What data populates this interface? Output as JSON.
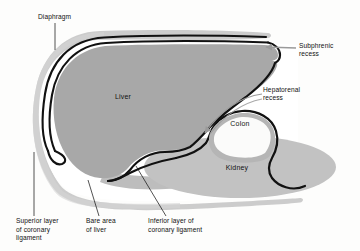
{
  "figure": {
    "background_color": "#fdfdfc"
  },
  "colors": {
    "body_wall": "#c9c9c9",
    "liver_fill": "#a8a8a8",
    "kidney_fill": "#c2c2c2",
    "bare_area_fill": "#bdbdbd",
    "colon_ring": "#b5b5b5",
    "colon_lumen": "#fbfbfa",
    "peritoneum_line": "#111111",
    "cavity_white": "#ffffff",
    "arrow_gray": "#9a9a9a",
    "leader_line": "#1a1a1a",
    "text": "#111111"
  },
  "organs": [
    {
      "name": "liver",
      "label": "Liver",
      "x": 123,
      "y": 99
    },
    {
      "name": "kidney",
      "label": "Kidney",
      "x": 237,
      "y": 170
    },
    {
      "name": "colon",
      "label": "Colon",
      "x": 238,
      "y": 124
    }
  ],
  "annotations": [
    {
      "name": "diaphragm",
      "label": "Diaphragm",
      "lines": [
        "Diaphragm"
      ],
      "text_x": 38,
      "text_y": 19,
      "anchor": "start",
      "leader": "M 55 23 L 55 50",
      "pointer_type": "line"
    },
    {
      "name": "subphrenic-recess",
      "label": "Subphrenic recess",
      "lines": [
        "Subphrenic",
        "recess"
      ],
      "text_x": 299,
      "text_y": 48,
      "anchor": "start",
      "leader": "M 296 48 L 265 48",
      "pointer_type": "arrow"
    },
    {
      "name": "hepatorenal-recess",
      "label": "Hepatorenal recess",
      "lines": [
        "Hepatorenal",
        "recess"
      ],
      "text_x": 263,
      "text_y": 92,
      "anchor": "start",
      "leader": "M 260 94 C 238 96 216 112 200 134",
      "pointer_type": "curved-arrow"
    },
    {
      "name": "superior-layer-coronary-ligament",
      "label": "Superior layer of coronary ligament",
      "lines": [
        "Superior layer",
        "of coronary",
        "ligament"
      ],
      "text_x": 16,
      "text_y": 223,
      "anchor": "start",
      "leader": "M 34 216 L 34 152",
      "pointer_type": "line"
    },
    {
      "name": "bare-area-of-liver",
      "label": "Bare area of liver",
      "lines": [
        "Bare area",
        "of liver"
      ],
      "text_x": 86,
      "text_y": 223,
      "anchor": "start",
      "leader": "M 99 216 L 88 180",
      "pointer_type": "line"
    },
    {
      "name": "inferior-layer-coronary-ligament",
      "label": "Inferior layer of coronary ligament",
      "lines": [
        "Inferior layer of",
        "coronary ligament"
      ],
      "text_x": 148,
      "text_y": 223,
      "anchor": "start",
      "leader": "M 166 216 L 136 166",
      "pointer_type": "line"
    }
  ]
}
